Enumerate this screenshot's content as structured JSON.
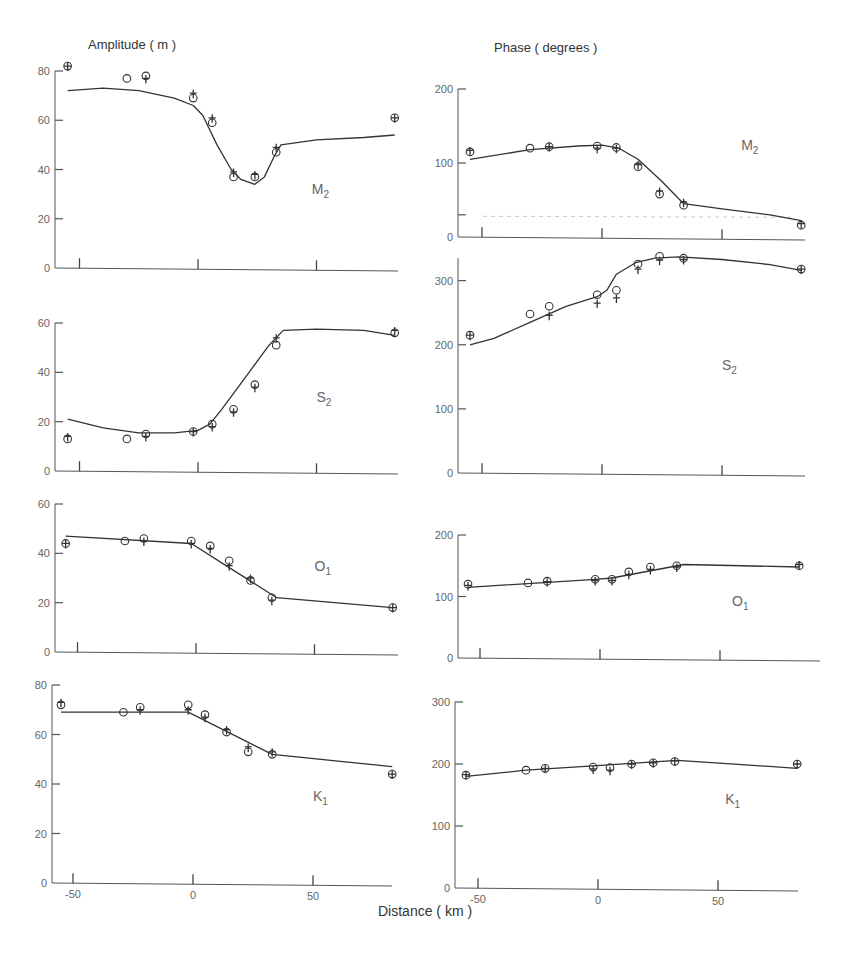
{
  "titles": {
    "left": "Amplitude ( m )",
    "right": "Phase ( degrees )",
    "xlabel": "Distance ( km )"
  },
  "chart_data": [
    {
      "type": "line",
      "id": "m2-amp",
      "title": "M2",
      "label_main": "M",
      "label_sub": "2",
      "ylabel": "Amplitude ( m )",
      "xlabel": "Distance ( km )",
      "xlim": [
        -60,
        85
      ],
      "ylim": [
        0,
        80
      ],
      "yticks": [
        0,
        20,
        40,
        60,
        80
      ],
      "xticks": [
        -50,
        0,
        50
      ],
      "curve": {
        "x": [
          -55,
          -40,
          -25,
          -10,
          -2,
          2,
          8,
          14,
          18,
          24,
          28,
          32,
          35,
          50,
          70,
          83
        ],
        "y": [
          72,
          73,
          72,
          69,
          66,
          62,
          50,
          40,
          36,
          34,
          37,
          45,
          50,
          52,
          53,
          54
        ]
      },
      "circles": {
        "x": [
          -55,
          -30,
          -22,
          -2,
          6,
          15,
          24,
          33,
          83
        ],
        "y": [
          82,
          77,
          78,
          69,
          59,
          37,
          37,
          47,
          61
        ]
      },
      "crosses": {
        "x": [
          -55,
          -22,
          -2,
          6,
          15,
          24,
          33,
          83
        ],
        "y": [
          82,
          77,
          71,
          61,
          39,
          38,
          49,
          61
        ]
      },
      "label_pos": {
        "x": 48,
        "y": 30
      }
    },
    {
      "type": "line",
      "id": "m2-phase",
      "title": "M2",
      "label_main": "M",
      "label_sub": "2",
      "ylabel": "Phase ( degrees )",
      "xlabel": "Distance ( km )",
      "xlim": [
        -60,
        85
      ],
      "ylim": [
        0,
        200
      ],
      "yticks": [
        0,
        100,
        200
      ],
      "xticks": [
        -50,
        0,
        50
      ],
      "extra_ytick": 30,
      "reference_dashed_y": 28,
      "curve": {
        "x": [
          -55,
          -30,
          -10,
          0,
          7,
          15,
          25,
          34,
          50,
          70,
          83
        ],
        "y": [
          105,
          118,
          123,
          124,
          120,
          105,
          75,
          45,
          38,
          30,
          22
        ]
      },
      "circles": {
        "x": [
          -55,
          -30,
          -22,
          -2,
          6,
          15,
          24,
          34,
          83
        ],
        "y": [
          115,
          120,
          122,
          123,
          121,
          95,
          58,
          43,
          16
        ]
      },
      "crosses": {
        "x": [
          -55,
          -22,
          -2,
          6,
          15,
          24,
          34,
          83
        ],
        "y": [
          117,
          122,
          120,
          120,
          98,
          62,
          47,
          18
        ]
      },
      "label_pos": {
        "x": 58,
        "y": 118
      }
    },
    {
      "type": "line",
      "id": "s2-amp",
      "title": "S2",
      "label_main": "S",
      "label_sub": "2",
      "ylabel": "Amplitude ( m )",
      "xlabel": "Distance ( km )",
      "xlim": [
        -60,
        85
      ],
      "ylim": [
        0,
        60
      ],
      "yticks": [
        0,
        20,
        40,
        60
      ],
      "xticks": [
        -50,
        0,
        50
      ],
      "curve": {
        "x": [
          -55,
          -40,
          -25,
          -10,
          0,
          5,
          10,
          20,
          30,
          36,
          50,
          70,
          83
        ],
        "y": [
          21,
          17.5,
          15.5,
          15.5,
          16.5,
          19,
          25,
          38,
          51,
          57,
          57.5,
          57,
          55
        ]
      },
      "circles": {
        "x": [
          -55,
          -30,
          -22,
          -2,
          6,
          15,
          24,
          33,
          83
        ],
        "y": [
          13,
          13,
          15,
          16,
          19,
          25,
          35,
          51,
          56
        ]
      },
      "crosses": {
        "x": [
          -55,
          -22,
          -2,
          6,
          15,
          24,
          33,
          83
        ],
        "y": [
          14,
          14,
          16,
          18,
          24,
          34,
          54,
          57
        ]
      },
      "label_pos": {
        "x": 50,
        "y": 28
      }
    },
    {
      "type": "line",
      "id": "s2-phase",
      "title": "S2",
      "label_main": "S",
      "label_sub": "2",
      "ylabel": "Phase ( degrees )",
      "xlabel": "Distance ( km )",
      "xlim": [
        -60,
        85
      ],
      "ylim": [
        0,
        340
      ],
      "yticks": [
        0,
        100,
        200,
        300
      ],
      "xticks": [
        -50,
        0,
        50
      ],
      "curve": {
        "x": [
          -55,
          -45,
          -30,
          -15,
          -2,
          2,
          6,
          14,
          22,
          32,
          50,
          70,
          83
        ],
        "y": [
          200,
          210,
          235,
          260,
          275,
          285,
          310,
          328,
          335,
          337,
          333,
          325,
          316
        ]
      },
      "circles": {
        "x": [
          -55,
          -30,
          -22,
          -2,
          6,
          15,
          24,
          34,
          83
        ],
        "y": [
          215,
          248,
          260,
          278,
          285,
          326,
          338,
          335,
          318
        ]
      },
      "crosses": {
        "x": [
          -55,
          -22,
          -2,
          6,
          15,
          24,
          34,
          83
        ],
        "y": [
          215,
          246,
          265,
          273,
          318,
          332,
          333,
          318
        ]
      },
      "label_pos": {
        "x": 50,
        "y": 160
      }
    },
    {
      "type": "line",
      "id": "o1-amp",
      "title": "O1",
      "label_main": "O",
      "label_sub": "1",
      "ylabel": "Amplitude ( m )",
      "xlabel": "Distance ( km )",
      "xlim": [
        -60,
        85
      ],
      "ylim": [
        0,
        60
      ],
      "yticks": [
        0,
        20,
        40,
        60
      ],
      "xticks": [
        -50,
        0,
        50
      ],
      "curve": {
        "x": [
          -55,
          -2,
          34,
          83
        ],
        "y": [
          47,
          44,
          22,
          18
        ]
      },
      "circles": {
        "x": [
          -55,
          -30,
          -22,
          -2,
          6,
          14,
          23,
          32,
          83
        ],
        "y": [
          44,
          45,
          46,
          45,
          43,
          37,
          29,
          22,
          18
        ]
      },
      "crosses": {
        "x": [
          -55,
          -22,
          -2,
          6,
          14,
          23,
          32,
          83
        ],
        "y": [
          44,
          45,
          44,
          42,
          35,
          30,
          21,
          18
        ]
      },
      "label_pos": {
        "x": 50,
        "y": 33
      }
    },
    {
      "type": "line",
      "id": "o1-phase",
      "title": "O1",
      "label_main": "O",
      "label_sub": "1",
      "ylabel": "Phase ( degrees )",
      "xlabel": "Distance ( km )",
      "xlim": [
        -60,
        85
      ],
      "ylim": [
        0,
        200
      ],
      "yticks": [
        0,
        100,
        200
      ],
      "xticks": [
        -50,
        0,
        50
      ],
      "curve": {
        "x": [
          -55,
          -2,
          5,
          35,
          83
        ],
        "y": [
          115,
          128,
          130,
          152,
          148
        ]
      },
      "circles": {
        "x": [
          -55,
          -30,
          -22,
          -2,
          5,
          12,
          21,
          32,
          83
        ],
        "y": [
          120,
          122,
          125,
          128,
          128,
          140,
          148,
          150,
          150
        ]
      },
      "crosses": {
        "x": [
          -55,
          -22,
          -2,
          5,
          12,
          21,
          32,
          83
        ],
        "y": [
          118,
          124,
          126,
          126,
          136,
          144,
          148,
          152
        ]
      },
      "label_pos": {
        "x": 55,
        "y": 85
      }
    },
    {
      "type": "line",
      "id": "k1-amp",
      "title": "K1",
      "label_main": "K",
      "label_sub": "1",
      "ylabel": "Amplitude ( m )",
      "xlabel": "Distance ( km )",
      "xlim": [
        -60,
        85
      ],
      "ylim": [
        0,
        80
      ],
      "yticks": [
        0,
        20,
        40,
        60,
        80
      ],
      "xticks": [
        -50,
        0,
        50
      ],
      "curve": {
        "x": [
          -55,
          -2,
          33,
          83
        ],
        "y": [
          69,
          69,
          52,
          47
        ]
      },
      "circles": {
        "x": [
          -55,
          -29,
          -22,
          -2,
          5,
          14,
          23,
          33,
          83
        ],
        "y": [
          72,
          69,
          71,
          72,
          68,
          61,
          53,
          52,
          44
        ]
      },
      "crosses": {
        "x": [
          -55,
          -22,
          -2,
          5,
          14,
          23,
          33,
          83
        ],
        "y": [
          73,
          70,
          70,
          67,
          62,
          55,
          53,
          44
        ]
      },
      "label_pos": {
        "x": 50,
        "y": 33
      }
    },
    {
      "type": "line",
      "id": "k1-phase",
      "title": "K1",
      "label_main": "K",
      "label_sub": "1",
      "ylabel": "Phase ( degrees )",
      "xlabel": "Distance ( km )",
      "xlim": [
        -60,
        85
      ],
      "ylim": [
        0,
        300
      ],
      "yticks": [
        0,
        100,
        200,
        300
      ],
      "xticks": [
        -50,
        0,
        50
      ],
      "curve": {
        "x": [
          -55,
          -30,
          -2,
          33,
          83
        ],
        "y": [
          180,
          190,
          197,
          206,
          193
        ]
      },
      "circles": {
        "x": [
          -55,
          -30,
          -22,
          -2,
          5,
          14,
          23,
          32,
          83
        ],
        "y": [
          182,
          190,
          193,
          195,
          194,
          200,
          202,
          204,
          200
        ]
      },
      "crosses": {
        "x": [
          -55,
          -22,
          -2,
          5,
          14,
          23,
          32,
          83
        ],
        "y": [
          183,
          193,
          192,
          190,
          200,
          202,
          205,
          200
        ]
      },
      "label_pos": {
        "x": 53,
        "y": 135
      }
    }
  ],
  "layout_panels": [
    {
      "x0": 55,
      "xzero": 198,
      "xscale": 2.37,
      "xend": 398,
      "ytop": 71,
      "ybot": 268,
      "axis_top": 71
    },
    {
      "x0": 458,
      "xzero": 602,
      "xscale": 2.4,
      "xend": 805,
      "ytop": 89,
      "ybot": 237,
      "axis_top": 89
    },
    {
      "x0": 55,
      "xzero": 198,
      "xscale": 2.37,
      "xend": 398,
      "ytop": 323,
      "ybot": 471,
      "axis_top": 323
    },
    {
      "x0": 458,
      "xzero": 602,
      "xscale": 2.4,
      "xend": 805,
      "ytop": 255,
      "ybot": 473,
      "axis_top": 258
    },
    {
      "x0": 55,
      "xzero": 196,
      "xscale": 2.37,
      "xend": 398,
      "ytop": 504,
      "ybot": 652,
      "axis_top": 504
    },
    {
      "x0": 458,
      "xzero": 600,
      "xscale": 2.4,
      "xend": 820,
      "ytop": 535,
      "ybot": 658,
      "axis_top": 535
    },
    {
      "x0": 52,
      "xzero": 193,
      "xscale": 2.4,
      "xend": 392,
      "ytop": 685,
      "ybot": 883,
      "axis_top": 685
    },
    {
      "x0": 455,
      "xzero": 598,
      "xscale": 2.4,
      "xend": 798,
      "ytop": 702,
      "ybot": 888,
      "axis_top": 702
    }
  ]
}
